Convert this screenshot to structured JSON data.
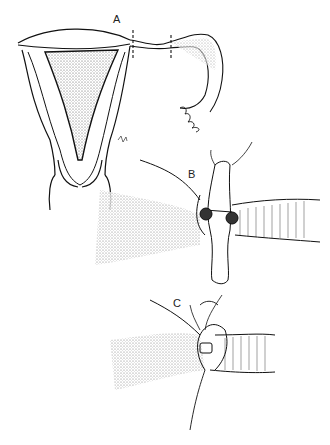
{
  "figure": {
    "panels": [
      {
        "id": "A",
        "label": "A",
        "description": "Uterus and fallopian tube with resection marks on tube"
      },
      {
        "id": "B",
        "label": "B",
        "description": "Tubal anastomosis with stent and stay sutures"
      },
      {
        "id": "C",
        "label": "C",
        "description": "Completed anastomosis with sutures"
      }
    ]
  }
}
